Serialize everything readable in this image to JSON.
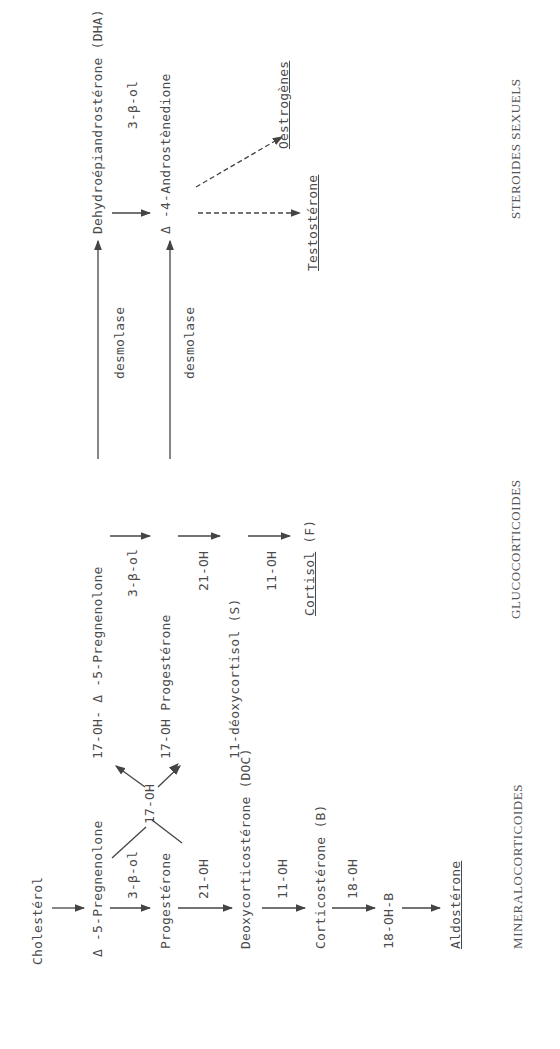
{
  "diagram": {
    "orientation": "rotated-90-ccw",
    "nodes": {
      "cholesterol": "Cholestérol",
      "pregnenolone": "Δ -5-Pregnenolone",
      "progesterone": "Progestérone",
      "doc": "Deoxycorticostérone (DOC)",
      "corticosterone": "Corticostérone (B)",
      "oh18b": "18-OH-B",
      "aldosterone": "Aldostérone",
      "oh17_pregnenolone": "17-OH- Δ -5-Pregnenolone",
      "oh17_progesterone": "17-OH Progestérone",
      "deoxycortisol": "11-déoxycortisol (S)",
      "cortisol": "Cortisol",
      "cortisol_suffix": "(F)",
      "dha": "Dehydroépiandrostérone (DHA)",
      "androstenedione": "Δ -4-Androstènedione",
      "testosterone": "Testostérone",
      "oestrogenes": "Oestrogènes"
    },
    "enzymes": {
      "beta3_a": "3-β-ol",
      "oh21_a": "21-OH",
      "oh11_a": "11-OH",
      "oh18": "18-OH",
      "oh17": "17-OH",
      "beta3_b": "3-β-ol",
      "oh21_b": "21-OH",
      "oh11_b": "11-OH",
      "desmolase_a": "desmolase",
      "desmolase_b": "desmolase",
      "beta3_c": "3-β-ol"
    },
    "categories": {
      "mineral": "MINERALOCORTICOIDES",
      "gluco": "GLUCOCORTICOIDES",
      "sexual": "STEROIDES SEXUELS"
    },
    "colors": {
      "ink": "#4a4a4a",
      "background": "#ffffff"
    }
  }
}
